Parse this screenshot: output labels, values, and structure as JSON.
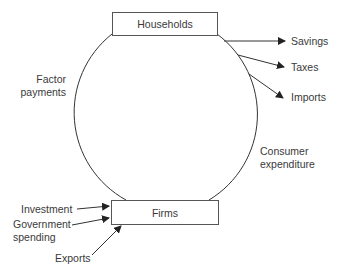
{
  "diagram": {
    "nodes": {
      "households": "Households",
      "firms": "Firms"
    },
    "flows": {
      "factor_payments": [
        "Factor",
        "payments"
      ],
      "consumer_expenditure": [
        "Consumer",
        "expenditure"
      ]
    },
    "leakages": [
      "Savings",
      "Taxes",
      "Imports"
    ],
    "injections": {
      "investment": "Investment",
      "government_spending": [
        "Government",
        "spending"
      ],
      "exports": "Exports"
    },
    "colors": {
      "line": "#333333",
      "box_border": "#555555",
      "text": "#3a3a3a"
    }
  }
}
